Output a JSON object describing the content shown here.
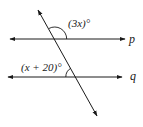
{
  "diagram": {
    "lines": [
      {
        "id": "p",
        "label": "p"
      },
      {
        "id": "q",
        "label": "q"
      }
    ],
    "angles": [
      {
        "id": "angle-top",
        "label": "(3x)°",
        "expr": "(3x)",
        "at_line": "p"
      },
      {
        "id": "angle-bottom",
        "label": "(x + 20)°",
        "expr": "(x + 20)",
        "at_line": "q"
      }
    ],
    "colors": {
      "stroke": "#1a1a1a",
      "background": "#ffffff"
    }
  }
}
